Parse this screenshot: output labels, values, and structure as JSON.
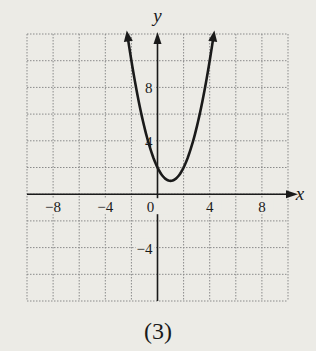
{
  "chart_data": {
    "type": "line",
    "title": "",
    "caption": "(3)",
    "xlabel": "x",
    "ylabel": "y",
    "xlim": [
      -10,
      10
    ],
    "ylim": [
      -8,
      12
    ],
    "grid": true,
    "grid_step": 2,
    "xticks": [
      {
        "value": -8,
        "label": "−8"
      },
      {
        "value": -4,
        "label": "−4"
      },
      {
        "value": 0,
        "label": "0"
      },
      {
        "value": 4,
        "label": "4"
      },
      {
        "value": 8,
        "label": "8"
      }
    ],
    "yticks": [
      {
        "value": 8,
        "label": "8"
      },
      {
        "value": 4,
        "label": "4"
      },
      {
        "value": -4,
        "label": "−4"
      }
    ],
    "series": [
      {
        "name": "parabola",
        "equation": "y = (x - 1)^2 + 1",
        "vertex": [
          1,
          1
        ],
        "x": [
          -2.3,
          -2,
          -1,
          0,
          1,
          2,
          3,
          4,
          4.3
        ],
        "y": [
          11.9,
          10,
          5,
          2,
          1,
          2,
          5,
          10,
          11.9
        ],
        "arrows_at_ends": true,
        "color": "#1a1a1a"
      }
    ]
  },
  "colors": {
    "background": "#ecebe6",
    "grid": "#8a8a8a",
    "axis": "#1a1a1a",
    "curve": "#1a1a1a"
  }
}
